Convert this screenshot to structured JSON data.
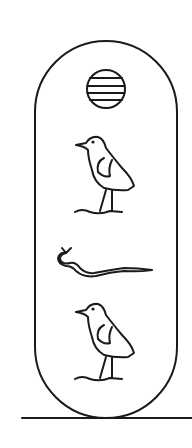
{
  "figure": {
    "glyphs": [
      {
        "name": "sun-disk",
        "label": "Sun disk (Ra)"
      },
      {
        "name": "bird",
        "label": "Bird"
      },
      {
        "name": "horned-viper",
        "label": "Horned viper"
      },
      {
        "name": "bird",
        "label": "Bird"
      }
    ],
    "colors": {
      "ink": "#1a1a1a",
      "background": "#ffffff"
    }
  }
}
